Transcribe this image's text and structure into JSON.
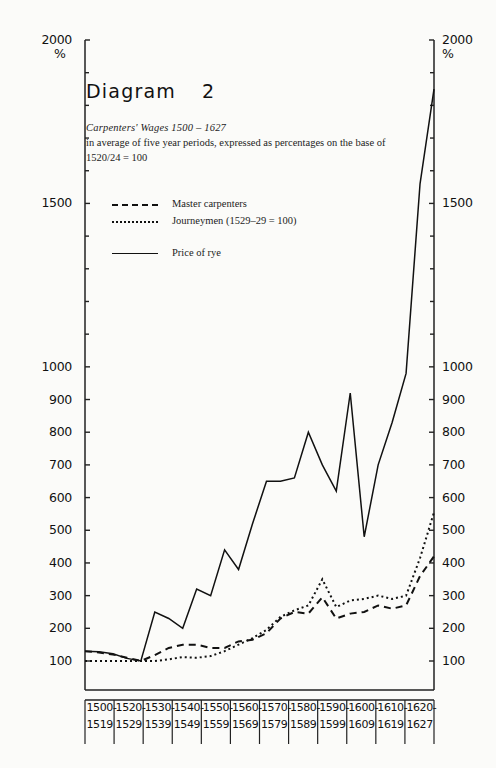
{
  "heading": {
    "text": "Diagram",
    "number": "2"
  },
  "caption": {
    "line1": "Carpenters' Wages 1500 – 1627",
    "line2": "in average of five year periods, expressed as percentages on the base of",
    "line3": "1520/24 = 100"
  },
  "legend": {
    "position": "inside-top-left",
    "items": [
      {
        "label": "Master carpenters",
        "style": "dashed"
      },
      {
        "label": "Journeymen (1529–29 = 100)",
        "style": "dotted"
      },
      {
        "label": "Price of rye",
        "style": "solid"
      }
    ]
  },
  "axes": {
    "y_unit": "%",
    "y_ticks": [
      100,
      200,
      300,
      400,
      500,
      600,
      700,
      800,
      900,
      1000,
      1500,
      2000
    ],
    "y_minor_ticks": [
      1100,
      1200,
      1300,
      1400,
      1600,
      1700,
      1800,
      1900
    ],
    "y_left_labels": [
      "100",
      "200",
      "300",
      "400",
      "500",
      "600",
      "700",
      "800",
      "900",
      "1000",
      "1500",
      "2000"
    ],
    "y_right_labels": [
      "100",
      "200",
      "300",
      "400",
      "500",
      "600",
      "700",
      "800",
      "900",
      "1000",
      "1500",
      "2000"
    ],
    "x_cells": [
      {
        "top": "1500-",
        "bottom": "1519"
      },
      {
        "top": "1520-",
        "bottom": "1529"
      },
      {
        "top": "1530-",
        "bottom": "1539"
      },
      {
        "top": "1540-",
        "bottom": "1549"
      },
      {
        "top": "1550-",
        "bottom": "1559"
      },
      {
        "top": "1560-",
        "bottom": "1569"
      },
      {
        "top": "1570-",
        "bottom": "1579"
      },
      {
        "top": "1580-",
        "bottom": "1589"
      },
      {
        "top": "1590-",
        "bottom": "1599"
      },
      {
        "top": "1600-",
        "bottom": "1609"
      },
      {
        "top": "1610-",
        "bottom": "1619"
      },
      {
        "top": "1620-",
        "bottom": "1627"
      }
    ]
  },
  "chart_data": {
    "type": "line",
    "subtitle": "Carpenters' Wages 1500 – 1627, in average of five year periods, expressed as percentages on the base of 1520/24 = 100",
    "xlabel": "",
    "ylabel": "%",
    "ylim": [
      0,
      2000
    ],
    "grid": false,
    "legend_position": "inside-top-left",
    "x_periods": [
      "1500/04",
      "1505/09",
      "1510/14",
      "1515/19",
      "1520/24",
      "1525/29",
      "1530/34",
      "1535/39",
      "1540/44",
      "1545/49",
      "1550/54",
      "1555/59",
      "1560/64",
      "1565/69",
      "1570/74",
      "1575/79",
      "1580/84",
      "1585/89",
      "1590/94",
      "1595/99",
      "1600/04",
      "1605/09",
      "1610/14",
      "1615/19",
      "1620/24",
      "1625/27"
    ],
    "series": [
      {
        "name": "Price of rye",
        "style": "solid",
        "values": [
          130,
          128,
          122,
          108,
          100,
          250,
          230,
          200,
          320,
          300,
          440,
          380,
          520,
          650,
          650,
          660,
          800,
          700,
          620,
          920,
          480,
          700,
          830,
          980,
          1560,
          1850
        ]
      },
      {
        "name": "Master carpenters",
        "style": "dashed",
        "values": [
          130,
          126,
          120,
          110,
          100,
          118,
          140,
          150,
          150,
          140,
          140,
          160,
          165,
          185,
          230,
          250,
          245,
          295,
          230,
          245,
          250,
          270,
          260,
          270,
          360,
          420
        ]
      },
      {
        "name": "Journeymen (1529–29 = 100)",
        "style": "dotted",
        "values": [
          100,
          100,
          100,
          100,
          100,
          100,
          105,
          112,
          110,
          115,
          130,
          150,
          170,
          195,
          235,
          255,
          270,
          350,
          265,
          285,
          290,
          300,
          290,
          300,
          415,
          555
        ]
      }
    ]
  }
}
